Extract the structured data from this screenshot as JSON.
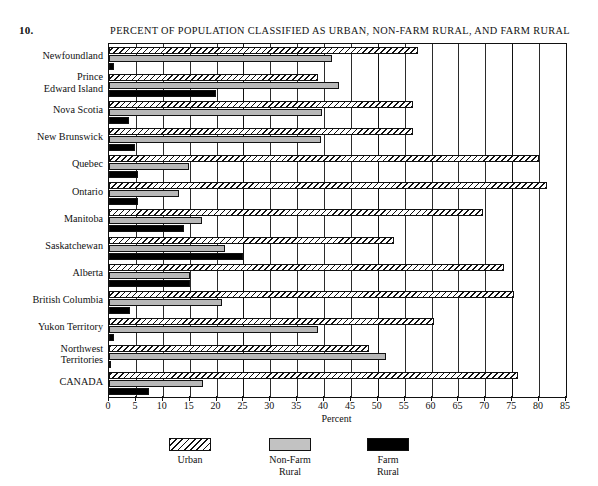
{
  "figure": {
    "number": "10.",
    "title": "PERCENT OF POPULATION CLASSIFIED AS URBAN, NON-FARM RURAL, AND FARM RURAL"
  },
  "legend": {
    "items": [
      {
        "key": "urban",
        "label": "Urban",
        "color": "#ffffff"
      },
      {
        "key": "nonfarm",
        "label": "Non-Farm\nRural",
        "color": "#b8b8b8"
      },
      {
        "key": "farm",
        "label": "Farm\nRural",
        "color": "#000000"
      }
    ]
  },
  "axis": {
    "x_title": "Percent",
    "x_ticks": [
      "0",
      "5",
      "10",
      "15",
      "20",
      "25",
      "30",
      "35",
      "40",
      "45",
      "50",
      "55",
      "60",
      "65",
      "70",
      "75",
      "80",
      "85"
    ],
    "x_min": 0,
    "x_max": 85,
    "x_step": 5
  },
  "chart_data": {
    "type": "bar",
    "orientation": "horizontal",
    "title": "PERCENT OF POPULATION CLASSIFIED AS URBAN, NON-FARM RURAL, AND FARM RURAL",
    "xlabel": "Percent",
    "ylabel": "",
    "xlim": [
      0,
      85
    ],
    "grid": true,
    "legend_position": "bottom-center",
    "categories": [
      "Newfoundland",
      "Prince\nEdward Island",
      "Nova Scotia",
      "New Brunswick",
      "Quebec",
      "Ontario",
      "Manitoba",
      "Saskatchewan",
      "Alberta",
      "British Columbia",
      "Yukon Territory",
      "Northwest\nTerritories",
      "CANADA"
    ],
    "series": [
      {
        "name": "Urban",
        "values": [
          57.5,
          38.9,
          56.6,
          56.6,
          80.0,
          81.5,
          69.5,
          53.0,
          73.5,
          75.3,
          60.5,
          48.3,
          76.0
        ]
      },
      {
        "name": "Non-Farm Rural",
        "values": [
          41.5,
          42.8,
          39.7,
          39.4,
          14.9,
          13.1,
          17.3,
          21.6,
          15.0,
          21.0,
          38.8,
          51.6,
          17.4
        ]
      },
      {
        "name": "Farm Rural",
        "values": [
          1.0,
          19.9,
          3.7,
          4.8,
          5.4,
          5.4,
          14.0,
          24.9,
          15.1,
          3.9,
          1.0,
          0.4,
          7.4
        ]
      }
    ]
  }
}
